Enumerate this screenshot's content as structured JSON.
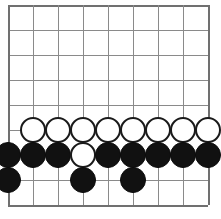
{
  "app": {
    "title": "Board Position",
    "surface_color": "#ffffff"
  },
  "board": {
    "name": "go-style-board",
    "columns": 9,
    "rows": 9,
    "cells_x": 8,
    "cells_y": 8,
    "origin_x": 8,
    "origin_y": 5,
    "spacing": 25,
    "line_color": "#8a8a8a",
    "edge_color": "#707070",
    "line_width": 1,
    "edge_width": 2,
    "column_labels": [
      "1",
      "2",
      "3",
      "4",
      "5",
      "6",
      "7",
      "8",
      "9"
    ],
    "row_labels": [
      "1",
      "2",
      "3",
      "4",
      "5",
      "6",
      "7",
      "8",
      "9"
    ]
  },
  "stones": {
    "radius": 13,
    "black_color": "#111111",
    "white_color": "#ffffff",
    "white_outline": "#1a1a1a",
    "black_count": 14,
    "white_count": 9,
    "total_count": 23,
    "items": [
      {
        "id": "w-r6-c2",
        "color": "white",
        "col": 2,
        "row": 6
      },
      {
        "id": "w-r6-c3",
        "color": "white",
        "col": 3,
        "row": 6
      },
      {
        "id": "w-r6-c4",
        "color": "white",
        "col": 4,
        "row": 6
      },
      {
        "id": "w-r6-c5",
        "color": "white",
        "col": 5,
        "row": 6
      },
      {
        "id": "w-r6-c6",
        "color": "white",
        "col": 6,
        "row": 6
      },
      {
        "id": "w-r6-c7",
        "color": "white",
        "col": 7,
        "row": 6
      },
      {
        "id": "w-r6-c8",
        "color": "white",
        "col": 8,
        "row": 6
      },
      {
        "id": "w-r6-c9",
        "color": "white",
        "col": 9,
        "row": 6
      },
      {
        "id": "b-r7-c1",
        "color": "black",
        "col": 1,
        "row": 7
      },
      {
        "id": "b-r7-c2",
        "color": "black",
        "col": 2,
        "row": 7
      },
      {
        "id": "b-r7-c3",
        "color": "black",
        "col": 3,
        "row": 7
      },
      {
        "id": "w-r7-c4",
        "color": "white",
        "col": 4,
        "row": 7
      },
      {
        "id": "b-r7-c5",
        "color": "black",
        "col": 5,
        "row": 7
      },
      {
        "id": "b-r7-c6",
        "color": "black",
        "col": 6,
        "row": 7
      },
      {
        "id": "b-r7-c7",
        "color": "black",
        "col": 7,
        "row": 7
      },
      {
        "id": "b-r7-c8",
        "color": "black",
        "col": 8,
        "row": 7
      },
      {
        "id": "b-r7-c9",
        "color": "black",
        "col": 9,
        "row": 7
      },
      {
        "id": "b-r8-c1",
        "color": "black",
        "col": 1,
        "row": 8
      },
      {
        "id": "b-r8-c4",
        "color": "black",
        "col": 4,
        "row": 8
      },
      {
        "id": "b-r8-c6",
        "color": "black",
        "col": 6,
        "row": 8
      }
    ]
  }
}
